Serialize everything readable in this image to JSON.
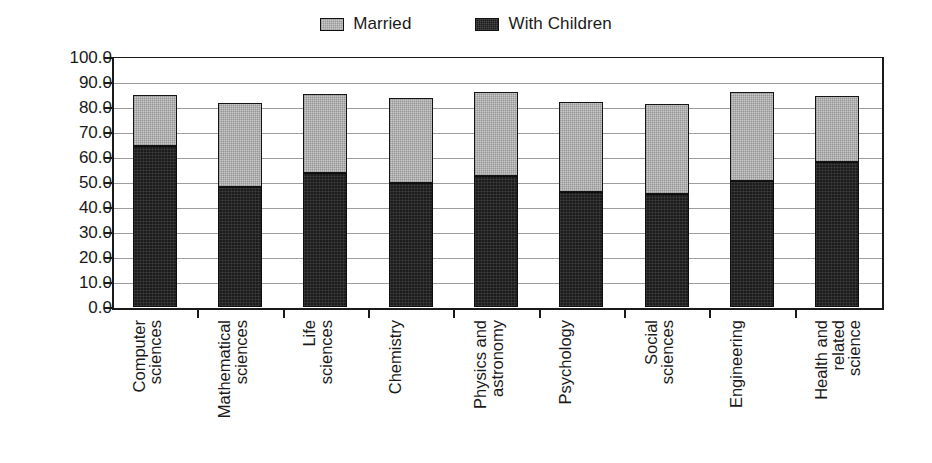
{
  "chart_data": {
    "type": "bar",
    "subtype": "stacked-bar",
    "title": "",
    "xlabel": "",
    "ylabel": "Percent Men",
    "ylim": [
      0,
      100
    ],
    "ytick_step": 10,
    "ytick_labels": [
      "100.0",
      "90.0",
      "80.0",
      "70.0",
      "60.0",
      "50.0",
      "40.0",
      "30.0",
      "20.0",
      "10.0",
      "0.0"
    ],
    "ytick_values": [
      100,
      90,
      80,
      70,
      60,
      50,
      40,
      30,
      20,
      10,
      0
    ],
    "grid": true,
    "grid_axis": "y",
    "legend_position": "top-center",
    "categories": [
      "Computer sciences",
      "Mathematical sciences",
      "Life sciences",
      "Chemistry",
      "Physics and astronomy",
      "Psychology",
      "Social sciences",
      "Engineering",
      "Health and related science"
    ],
    "category_lines": [
      [
        "Computer",
        "sciences"
      ],
      [
        "Mathematical",
        "sciences"
      ],
      [
        "Life",
        "sciences"
      ],
      [
        "Chemistry"
      ],
      [
        "Physics and",
        "astronomy"
      ],
      [
        "Psychology"
      ],
      [
        "Social",
        "sciences"
      ],
      [
        "Engineering"
      ],
      [
        "Health and",
        "related",
        "science"
      ]
    ],
    "series": [
      {
        "name": "Married",
        "color": "#c8c8c8",
        "values": [
          84.8,
          81.5,
          85.3,
          83.5,
          86.0,
          82.0,
          81.3,
          86.0,
          84.5
        ],
        "note": "values are the total bar top (cumulative), Married is the upper segment"
      },
      {
        "name": "With Children",
        "color": "#1c1c1c",
        "values": [
          64.5,
          48.0,
          53.5,
          49.5,
          52.5,
          46.0,
          45.3,
          50.5,
          58.0
        ]
      }
    ]
  },
  "legend": {
    "items": [
      {
        "label": "Married",
        "swatch": "married"
      },
      {
        "label": "With Children",
        "swatch": "children"
      }
    ]
  },
  "axes": {
    "y_title": "Percent Men"
  }
}
